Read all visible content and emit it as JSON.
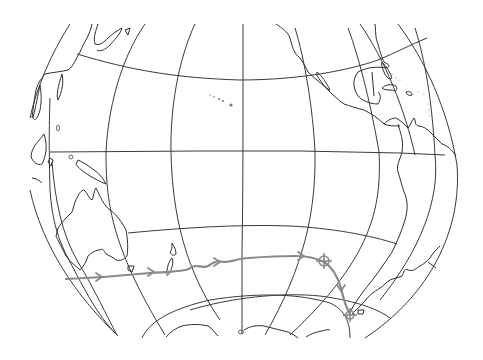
{
  "map": {
    "title": "",
    "type": "hand-drawn globe outline map",
    "projection": "orthographic globe view centered on the Pacific Ocean",
    "colors": {
      "background": "#ffffff",
      "coastline": "#2e2e2e",
      "graticule": "#3a3a3a",
      "route": "#8a8a8a"
    },
    "regions_visible": [
      "Asia (east coast, Japan)",
      "Philippines / Indonesia",
      "New Guinea",
      "Australia",
      "Tasmania",
      "New Zealand",
      "Hawaiian Islands",
      "North America (west coast)",
      "Baja California",
      "Florida",
      "Gulf of Mexico",
      "Caribbean islands",
      "Central America",
      "South America",
      "Cape Horn",
      "Antarctica"
    ],
    "route": {
      "description": "Voyage track heading east across the Southern Pacific from south of Australia, passing south of New Zealand, to a marked point, then turning south-east toward Cape Horn",
      "direction_arrows": 5,
      "waypoint_markers": 2,
      "markers": [
        {
          "name": "mid-ocean waypoint",
          "symbol": "crosshair-circle"
        },
        {
          "name": "Cape Horn endpoint",
          "symbol": "crosshair-circle"
        }
      ]
    },
    "labels": []
  }
}
